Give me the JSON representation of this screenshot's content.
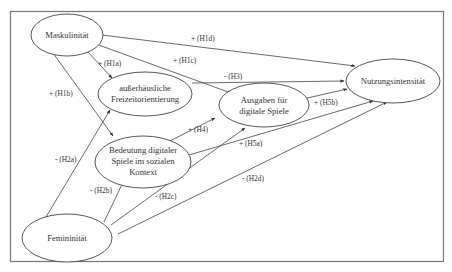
{
  "diagram": {
    "title": "",
    "nodes": [
      {
        "id": "maskulinitaet",
        "lines": [
          "Maskulinität"
        ]
      },
      {
        "id": "freizeit",
        "lines": [
          "außerhäusliche",
          "Freizeitorientierung"
        ]
      },
      {
        "id": "ausgaben",
        "lines": [
          "Ausgaben für",
          "digitale Spiele"
        ]
      },
      {
        "id": "bedeutung",
        "lines": [
          "Bedeutung digitaler",
          "Spiele im sozialen",
          "Kontext"
        ]
      },
      {
        "id": "nutzung",
        "lines": [
          "Nutzungsintensität"
        ]
      },
      {
        "id": "femininitaet",
        "lines": [
          "Femininität"
        ]
      }
    ],
    "edges": [
      {
        "from": "maskulinitaet",
        "to": "freizeit",
        "label": "+ (H1a)"
      },
      {
        "from": "maskulinitaet",
        "to": "bedeutung",
        "label": "+ (H1b)"
      },
      {
        "from": "maskulinitaet",
        "to": "ausgaben",
        "label": "+ (H1c)"
      },
      {
        "from": "maskulinitaet",
        "to": "nutzung",
        "label": "+ (H1d)"
      },
      {
        "from": "femininitaet",
        "to": "freizeit",
        "label": "- (H2a)"
      },
      {
        "from": "femininitaet",
        "to": "bedeutung",
        "label": "- (H2b)"
      },
      {
        "from": "femininitaet",
        "to": "ausgaben",
        "label": "- (H2c)"
      },
      {
        "from": "femininitaet",
        "to": "nutzung",
        "label": "- (H2d)"
      },
      {
        "from": "freizeit",
        "to": "nutzung",
        "label": "- (H3)"
      },
      {
        "from": "bedeutung",
        "to": "ausgaben",
        "label": "+ (H4)"
      },
      {
        "from": "bedeutung",
        "to": "nutzung",
        "label": "+ (H5a)"
      },
      {
        "from": "ausgaben",
        "to": "nutzung",
        "label": "+ (H5b)"
      }
    ]
  }
}
